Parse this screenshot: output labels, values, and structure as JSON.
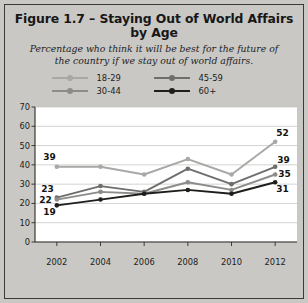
{
  "figure": {
    "title": "Figure 1.7 – Staying Out of World Affairs by Age",
    "subtitle": "Percentage who think it will be best for the future of the country if we stay out of world affairs."
  },
  "legend": {
    "position": "top",
    "items": [
      {
        "label": "18-29",
        "color": "#a8a8a6"
      },
      {
        "label": "45-59",
        "color": "#6e6e6c"
      },
      {
        "label": "30-44",
        "color": "#8c8c8a"
      },
      {
        "label": "60+",
        "color": "#1e1e1c"
      }
    ]
  },
  "axes": {
    "y_ticks": [
      "0",
      "10",
      "20",
      "30",
      "40",
      "50",
      "60",
      "70"
    ],
    "x_ticks": [
      "2002",
      "2004",
      "2006",
      "2008",
      "2010",
      "2012"
    ]
  },
  "chart_data": {
    "type": "line",
    "title": "Figure 1.7 – Staying Out of World Affairs by Age",
    "subtitle": "Percentage who think it will be best for the future of the country if we stay out of world affairs.",
    "xlabel": "",
    "ylabel": "",
    "x": [
      2002,
      2004,
      2006,
      2008,
      2010,
      2012
    ],
    "categories": [
      "2002",
      "2004",
      "2006",
      "2008",
      "2010",
      "2012"
    ],
    "ylim": [
      0,
      70
    ],
    "ytick_step": 10,
    "grid": true,
    "legend_position": "top",
    "series": [
      {
        "name": "18-29",
        "color": "#a8a8a6",
        "values": [
          39,
          39,
          35,
          43,
          35,
          52
        ],
        "labels": {
          "2002": "39",
          "2012": "52"
        }
      },
      {
        "name": "45-59",
        "color": "#6e6e6c",
        "values": [
          23,
          29,
          26,
          38,
          30,
          39
        ],
        "labels": {
          "2002": "23",
          "2012": "39"
        }
      },
      {
        "name": "30-44",
        "color": "#8c8c8a",
        "values": [
          22,
          26,
          25,
          31,
          27,
          35
        ],
        "labels": {
          "2002": "22",
          "2012": "35"
        }
      },
      {
        "name": "60+",
        "color": "#1e1e1c",
        "values": [
          19,
          22,
          25,
          27,
          25,
          31
        ],
        "labels": {
          "2002": "19",
          "2012": "31"
        }
      }
    ],
    "point_labels": [
      {
        "series": "18-29",
        "x": 2002,
        "value": 39,
        "text": "39"
      },
      {
        "series": "45-59",
        "x": 2002,
        "value": 23,
        "text": "23"
      },
      {
        "series": "30-44",
        "x": 2002,
        "value": 22,
        "text": "22"
      },
      {
        "series": "60+",
        "x": 2002,
        "value": 19,
        "text": "19"
      },
      {
        "series": "18-29",
        "x": 2012,
        "value": 52,
        "text": "52"
      },
      {
        "series": "45-59",
        "x": 2012,
        "value": 39,
        "text": "39"
      },
      {
        "series": "30-44",
        "x": 2012,
        "value": 35,
        "text": "35"
      },
      {
        "series": "60+",
        "x": 2012,
        "value": 31,
        "text": "31"
      }
    ]
  }
}
